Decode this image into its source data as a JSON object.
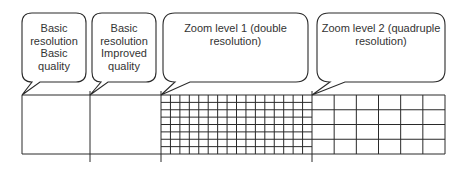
{
  "diagram": {
    "stroke_color": "#2a2a2a",
    "bubbles": [
      {
        "lines": [
          "Basic",
          "resolution",
          "Basic",
          "quality"
        ]
      },
      {
        "lines": [
          "Basic",
          "resolution",
          "Improved",
          "quality"
        ]
      },
      {
        "lines": [
          "Zoom level 1 (double",
          "resolution)"
        ]
      },
      {
        "lines": [
          "Zoom level 2 (quadruple",
          "resolution)"
        ]
      }
    ],
    "sections": [
      {
        "name": "basic-quality",
        "cols": 1,
        "rows": 1
      },
      {
        "name": "improved-quality",
        "cols": 1,
        "rows": 1
      },
      {
        "name": "zoom-level-1",
        "cols": 16,
        "rows": 8
      },
      {
        "name": "zoom-level-2",
        "cols": 6,
        "rows": 4
      }
    ]
  }
}
